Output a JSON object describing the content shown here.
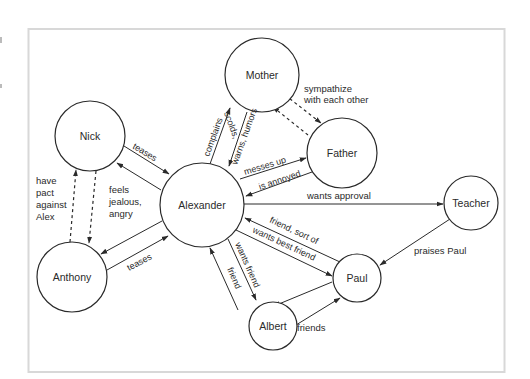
{
  "diagram": {
    "type": "relationship-map",
    "colors": {
      "line": "#2a2a2a",
      "frame": "#d8d8d8",
      "background": "#ffffff",
      "text": "#2a2a2a"
    },
    "nodes": [
      {
        "id": "mother",
        "label": "Mother",
        "cx": 262,
        "cy": 75,
        "r": 37
      },
      {
        "id": "father",
        "label": "Father",
        "cx": 342,
        "cy": 153,
        "r": 35
      },
      {
        "id": "nick",
        "label": "Nick",
        "cx": 90,
        "cy": 136,
        "r": 35
      },
      {
        "id": "alexander",
        "label": "Alexander",
        "cx": 202,
        "cy": 205,
        "r": 42
      },
      {
        "id": "anthony",
        "label": "Anthony",
        "cx": 72,
        "cy": 277,
        "r": 35
      },
      {
        "id": "teacher",
        "label": "Teacher",
        "cx": 471,
        "cy": 203,
        "r": 27
      },
      {
        "id": "paul",
        "label": "Paul",
        "cx": 357,
        "cy": 278,
        "r": 24
      },
      {
        "id": "albert",
        "label": "Albert",
        "cx": 273,
        "cy": 326,
        "r": 24
      }
    ],
    "edges": [
      {
        "from": "nick",
        "to": "alexander",
        "label": "teases",
        "style": "solid"
      },
      {
        "from": "alexander",
        "to": "nick",
        "label": "feels jealous, angry",
        "style": "solid"
      },
      {
        "from": "anthony",
        "to": "alexander",
        "label": "teases",
        "style": "solid"
      },
      {
        "from": "alexander",
        "to": "anthony",
        "label": "",
        "style": "solid"
      },
      {
        "from": "nick",
        "to": "anthony",
        "label": "have pact against Alex",
        "style": "dashed"
      },
      {
        "from": "anthony",
        "to": "nick",
        "label": "",
        "style": "dashed"
      },
      {
        "from": "alexander",
        "to": "mother",
        "label": "complains",
        "style": "solid"
      },
      {
        "from": "mother",
        "to": "alexander",
        "label": "scolds, warns, humors",
        "style": "solid"
      },
      {
        "from": "alexander",
        "to": "father",
        "label": "messes up",
        "style": "solid"
      },
      {
        "from": "father",
        "to": "alexander",
        "label": "is annoyed",
        "style": "solid"
      },
      {
        "from": "mother",
        "to": "father",
        "label": "sympathize with each other",
        "style": "dashed"
      },
      {
        "from": "father",
        "to": "mother",
        "label": "",
        "style": "dashed"
      },
      {
        "from": "alexander",
        "to": "teacher",
        "label": "wants approval",
        "style": "solid"
      },
      {
        "from": "teacher",
        "to": "paul",
        "label": "praises Paul",
        "style": "solid"
      },
      {
        "from": "paul",
        "to": "alexander",
        "label": "friend, sort of",
        "style": "solid"
      },
      {
        "from": "alexander",
        "to": "paul",
        "label": "wants best friend",
        "style": "solid"
      },
      {
        "from": "alexander",
        "to": "albert",
        "label": "wants friend",
        "style": "solid"
      },
      {
        "from": "albert",
        "to": "alexander",
        "label": "friend",
        "style": "solid"
      },
      {
        "from": "albert",
        "to": "paul",
        "label": "friends",
        "style": "solid"
      },
      {
        "from": "paul",
        "to": "albert",
        "label": "",
        "style": "solid"
      }
    ],
    "labels": {
      "teases_nick": "teases",
      "teases_anthony": "teases",
      "feels_1": "feels",
      "feels_2": "jealous,",
      "feels_3": "angry",
      "pact_1": "have",
      "pact_2": "pact",
      "pact_3": "against",
      "pact_4": "Alex",
      "complains": "complains",
      "scolds": "scolds,",
      "warns": "warns, humors",
      "sympathize_1": "sympathize",
      "sympathize_2": "with each other",
      "messes_up": "messes up",
      "is_annoyed": "is annoyed",
      "wants_approval": "wants approval",
      "praises_paul": "praises Paul",
      "friend_sort_of": "friend, sort of",
      "wants_best_friend": "wants best friend",
      "wants_friend": "wants friend",
      "friend": "friend",
      "friends": "friends"
    }
  }
}
